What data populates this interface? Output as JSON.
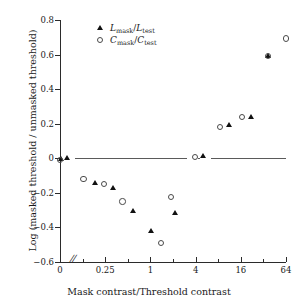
{
  "chart_data": {
    "type": "scatter",
    "title": "",
    "xlabel": "Mask contrast/Threshold contrast",
    "ylabel": "Log (masked threshold / unmasked threshold)",
    "x_scale": "log4-with-axis-break",
    "x_tick_labels": [
      "0",
      "0.25",
      "1",
      "4",
      "16",
      "64"
    ],
    "x_tick_units": [
      0,
      1,
      2,
      3,
      4,
      5
    ],
    "x_minor_tick_units": [
      0.5,
      1.5,
      2.5,
      3.5,
      4.5
    ],
    "xlim_units": [
      0,
      5
    ],
    "y_tick_labels": [
      "0.8",
      "0.6",
      "0.4",
      "0.2",
      "0",
      "-0.2",
      "-0.4",
      "-0.6"
    ],
    "y_tick_values": [
      0.8,
      0.6,
      0.4,
      0.2,
      0,
      -0.2,
      -0.4,
      -0.6
    ],
    "ylim": [
      -0.6,
      0.8
    ],
    "grid": false,
    "legend_position": "top-left-inside",
    "reference_line_y": 0,
    "axis_break_marker": "//",
    "series": [
      {
        "name": "L_mask/L_test",
        "marker": "filled-triangle",
        "color": "#111111",
        "points": [
          {
            "xunit": 0.02,
            "y": -0.005
          },
          {
            "xunit": 0.17,
            "y": 0.0
          },
          {
            "xunit": 0.79,
            "y": -0.143
          },
          {
            "xunit": 1.18,
            "y": -0.175
          },
          {
            "xunit": 1.62,
            "y": -0.305
          },
          {
            "xunit": 2.03,
            "y": -0.423
          },
          {
            "xunit": 2.56,
            "y": -0.315
          },
          {
            "xunit": 3.18,
            "y": 0.012
          },
          {
            "xunit": 3.75,
            "y": 0.193
          },
          {
            "xunit": 4.24,
            "y": 0.237
          },
          {
            "xunit": 4.62,
            "y": 0.59
          }
        ]
      },
      {
        "name": "C_mask/C_test",
        "marker": "open-circle",
        "color": "#4a4a4a",
        "points": [
          {
            "xunit": 0.0,
            "y": -0.008
          },
          {
            "xunit": 0.52,
            "y": -0.118
          },
          {
            "xunit": 0.97,
            "y": -0.148
          },
          {
            "xunit": 1.38,
            "y": -0.25
          },
          {
            "xunit": 2.23,
            "y": -0.488
          },
          {
            "xunit": 2.45,
            "y": -0.222
          },
          {
            "xunit": 2.98,
            "y": 0.007
          },
          {
            "xunit": 3.54,
            "y": 0.182
          },
          {
            "xunit": 4.02,
            "y": 0.24
          },
          {
            "xunit": 4.6,
            "y": 0.592
          },
          {
            "xunit": 5.0,
            "y": 0.693
          }
        ]
      }
    ]
  },
  "legend": {
    "entries": [
      {
        "base": "L",
        "sub": "mask",
        "slash": "/",
        "base2": "L",
        "sub2": "test",
        "marker": "filled-triangle"
      },
      {
        "base": "C",
        "sub": "mask",
        "slash": "/",
        "base2": "C",
        "sub2": "test",
        "marker": "open-circle"
      }
    ]
  }
}
